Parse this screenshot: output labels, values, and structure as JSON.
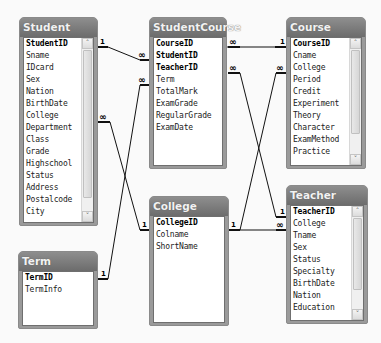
{
  "diagram": {
    "type": "database-relationships",
    "tables": [
      {
        "id": "Student",
        "title": "Student",
        "primary_key": "StudentID",
        "fields": [
          "StudentID",
          "Sname",
          "IDcard",
          "Sex",
          "Nation",
          "BirthDate",
          "College",
          "Department",
          "Class",
          "Grade",
          "Highschool",
          "Status",
          "Address",
          "Postalcode",
          "City"
        ],
        "scrollable": true
      },
      {
        "id": "StudentCourse",
        "title": "StudentCourse",
        "primary_key": [
          "CourseID",
          "StudentID",
          "TeacherID"
        ],
        "fields": [
          "CourseID",
          "StudentID",
          "TeacherID",
          "Term",
          "TotalMark",
          "ExamGrade",
          "RegularGrade",
          "ExamDate"
        ],
        "scrollable": false
      },
      {
        "id": "Course",
        "title": "Course",
        "primary_key": "CourseID",
        "fields": [
          "CourseID",
          "Cname",
          "College",
          "Period",
          "Credit",
          "Experiment",
          "Theory",
          "Character",
          "ExamMethod",
          "Practice"
        ],
        "scrollable": true
      },
      {
        "id": "College",
        "title": "College",
        "primary_key": "CollegeID",
        "fields": [
          "CollegeID",
          "Colname",
          "ShortName"
        ],
        "scrollable": false
      },
      {
        "id": "Term",
        "title": "Term",
        "primary_key": "TermID",
        "fields": [
          "TermID",
          "TermInfo"
        ],
        "scrollable": false
      },
      {
        "id": "Teacher",
        "title": "Teacher",
        "primary_key": "TeacherID",
        "fields": [
          "TeacherID",
          "College",
          "Tname",
          "Sex",
          "Status",
          "Specialty",
          "BirthDate",
          "Nation",
          "Education"
        ],
        "scrollable": true
      }
    ],
    "relationships": [
      {
        "from": "Student.StudentID",
        "from_card": "1",
        "to": "StudentCourse.StudentID",
        "to_card": "∞"
      },
      {
        "from": "Term.TermID",
        "from_card": "1",
        "to": "StudentCourse.Term",
        "to_card": "∞"
      },
      {
        "from": "Student.College",
        "from_card": "∞",
        "to": "College.CollegeID",
        "to_card": "1"
      },
      {
        "from": "StudentCourse.CourseID",
        "from_card": "∞",
        "to": "Course.CourseID",
        "to_card": "1"
      },
      {
        "from": "StudentCourse.TeacherID",
        "from_card": "∞",
        "to": "Teacher.TeacherID",
        "to_card": "1"
      },
      {
        "from": "Course.College",
        "from_card": "∞",
        "to": "College.CollegeID",
        "to_card": "1"
      },
      {
        "from": "Teacher.College",
        "from_card": "∞",
        "to": "College.CollegeID",
        "to_card": "1"
      }
    ],
    "labels": {
      "one": "1",
      "many": "∞",
      "scroll_up": "˄",
      "scroll_down": "˅"
    }
  },
  "colors": {
    "header_top": "#8e8e8e",
    "header_bottom": "#6c6c6c",
    "frame": "#9a9a9a",
    "line": "#111111",
    "background": "#fafafa"
  }
}
